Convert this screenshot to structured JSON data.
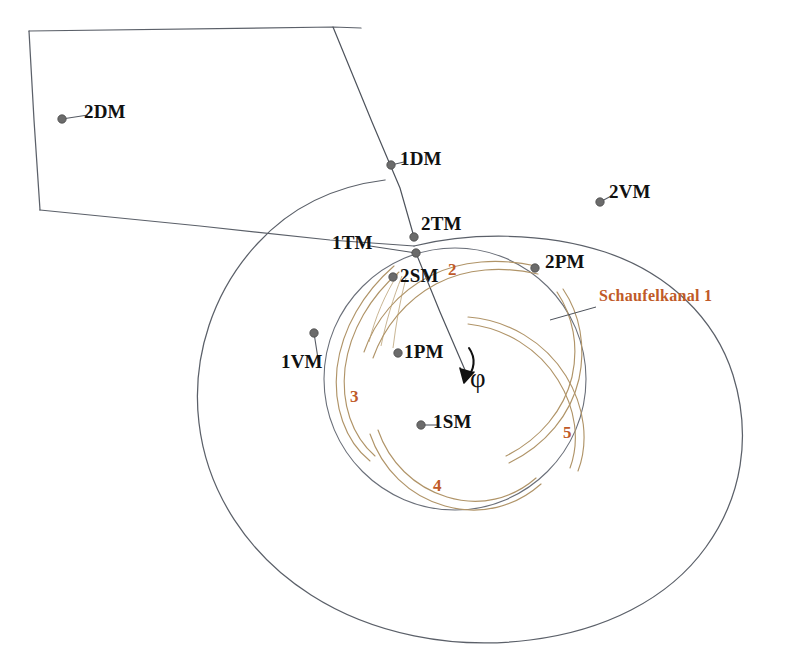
{
  "figure": {
    "kind": "centrifugal-pump-volute-cross-section",
    "background_color": "#ffffff",
    "line_color": "#555a63",
    "blade_color": "#b59a6a",
    "accent_color": "#c05a28",
    "marker_color": "#6b6b6b"
  },
  "rotation": {
    "symbol": "φ",
    "label_x": 470,
    "label_y": 363
  },
  "annotations": [
    {
      "id": "schaufelkanal-1",
      "text": "Schaufelkanal 1",
      "x": 599,
      "y": 287,
      "leader": {
        "x1": 596,
        "y1": 307,
        "x2": 550,
        "y2": 320
      }
    }
  ],
  "channel_numbers": [
    {
      "id": "channel-2",
      "text": "2",
      "x": 448,
      "y": 260
    },
    {
      "id": "channel-3",
      "text": "3",
      "x": 350,
      "y": 387
    },
    {
      "id": "channel-4",
      "text": "4",
      "x": 433,
      "y": 476
    },
    {
      "id": "channel-5",
      "text": "5",
      "x": 563,
      "y": 423
    }
  ],
  "measurement_points": [
    {
      "id": "2DM",
      "label": "2DM",
      "dot_x": 62,
      "dot_y": 119,
      "label_x": 84,
      "label_y": 101,
      "leader": true
    },
    {
      "id": "1DM",
      "label": "1DM",
      "dot_x": 391,
      "dot_y": 165,
      "label_x": 400,
      "label_y": 148,
      "leader": true
    },
    {
      "id": "2VM",
      "label": "2VM",
      "dot_x": 600,
      "dot_y": 202,
      "label_x": 609,
      "label_y": 181,
      "leader": true
    },
    {
      "id": "2TM",
      "label": "2TM",
      "dot_x": 414,
      "dot_y": 237,
      "label_x": 421,
      "label_y": 213,
      "leader": false
    },
    {
      "id": "1TM",
      "label": "1TM",
      "dot_x": 416,
      "dot_y": 253,
      "label_x": 332,
      "label_y": 232,
      "leader": true
    },
    {
      "id": "2PM",
      "label": "2PM",
      "dot_x": 535,
      "dot_y": 268,
      "label_x": 545,
      "label_y": 251,
      "leader": false
    },
    {
      "id": "2SM",
      "label": "2SM",
      "dot_x": 393,
      "dot_y": 277,
      "label_x": 400,
      "label_y": 265,
      "leader": false
    },
    {
      "id": "1VM",
      "label": "1VM",
      "dot_x": 314,
      "dot_y": 333,
      "label_x": 281,
      "label_y": 351,
      "leader": true
    },
    {
      "id": "1PM",
      "label": "1PM",
      "dot_x": 398,
      "dot_y": 353,
      "label_x": 404,
      "label_y": 341,
      "leader": false
    },
    {
      "id": "1SM",
      "label": "1SM",
      "dot_x": 421,
      "dot_y": 425,
      "label_x": 433,
      "label_y": 411,
      "leader": true
    }
  ]
}
